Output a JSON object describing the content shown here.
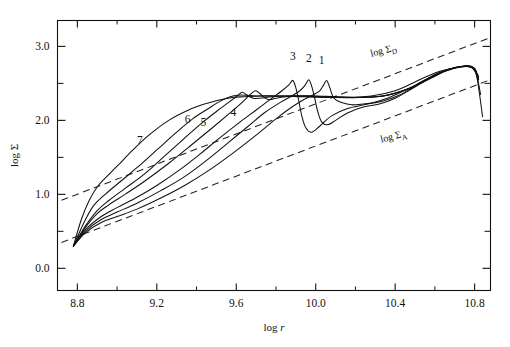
{
  "chart_data": {
    "type": "line",
    "title": "",
    "xlabel": "log r",
    "ylabel": "log Σ",
    "xlim": [
      8.7,
      10.88
    ],
    "ylim": [
      -0.3,
      3.35
    ],
    "grid": false,
    "legend_position": "inline-annotations",
    "x_major_ticks": [
      "8.8",
      "9.2",
      "9.6",
      "10.0",
      "10.4",
      "10.8"
    ],
    "x_major_values": [
      8.8,
      9.2,
      9.6,
      10.0,
      10.4,
      10.8
    ],
    "x_minor_values": [
      9.0,
      9.4,
      9.8,
      10.2,
      10.6
    ],
    "y_major_ticks": [
      "0.0",
      "1.0",
      "2.0",
      "3.0"
    ],
    "y_major_values": [
      0.0,
      1.0,
      2.0,
      3.0
    ],
    "y_minor_values": [
      0.5,
      1.5,
      2.5
    ],
    "annotations": [
      {
        "text": "log Σ",
        "sub": "D",
        "x": 10.28,
        "y": 2.86,
        "rotation": -14,
        "name": "sigma-d-label"
      },
      {
        "text": "log Σ",
        "sub": "A",
        "x": 10.33,
        "y": 1.7,
        "rotation": -14,
        "name": "sigma-a-label"
      }
    ],
    "reference_lines": [
      {
        "name": "log Σ_D",
        "style": "dashed",
        "x": [
          8.72,
          10.88
        ],
        "y": [
          0.92,
          3.12
        ]
      },
      {
        "name": "log Σ_A",
        "style": "dashed",
        "x": [
          8.72,
          10.88
        ],
        "y": [
          0.35,
          2.55
        ]
      }
    ],
    "series": [
      {
        "name": "1",
        "label": "1",
        "label_x": 10.03,
        "label_y": 2.76,
        "x": [
          8.78,
          8.84,
          8.92,
          9.0,
          9.1,
          9.22,
          9.34,
          9.46,
          9.58,
          9.7,
          9.8,
          9.88,
          9.94,
          9.99,
          10.02,
          10.04,
          10.055,
          10.07,
          10.085,
          10.1,
          10.13,
          10.18,
          10.24,
          10.3,
          10.36,
          10.42,
          10.48,
          10.54,
          10.6,
          10.66,
          10.72,
          10.76,
          10.79,
          10.81,
          10.825,
          10.84
        ],
        "y": [
          0.3,
          0.48,
          0.62,
          0.7,
          0.8,
          0.95,
          1.12,
          1.32,
          1.55,
          1.8,
          2.02,
          2.18,
          2.28,
          2.35,
          2.4,
          2.48,
          2.54,
          2.45,
          2.33,
          2.28,
          2.24,
          2.21,
          2.22,
          2.24,
          2.28,
          2.34,
          2.43,
          2.53,
          2.62,
          2.68,
          2.72,
          2.74,
          2.72,
          2.6,
          2.35,
          2.05
        ]
      },
      {
        "name": "2",
        "label": "2",
        "label_x": 9.965,
        "label_y": 2.79,
        "x": [
          8.78,
          8.84,
          8.92,
          9.0,
          9.1,
          9.22,
          9.34,
          9.46,
          9.56,
          9.66,
          9.74,
          9.82,
          9.88,
          9.92,
          9.945,
          9.965,
          9.98,
          9.995,
          10.01,
          10.03,
          10.06,
          10.1,
          10.16,
          10.24,
          10.32,
          10.4,
          10.48,
          10.56,
          10.64,
          10.7,
          10.75,
          10.79,
          10.81,
          10.83
        ],
        "y": [
          0.3,
          0.5,
          0.66,
          0.76,
          0.88,
          1.05,
          1.24,
          1.48,
          1.7,
          1.92,
          2.1,
          2.24,
          2.33,
          2.4,
          2.47,
          2.55,
          2.46,
          2.3,
          2.12,
          1.98,
          1.94,
          2.0,
          2.1,
          2.18,
          2.22,
          2.3,
          2.42,
          2.55,
          2.66,
          2.71,
          2.73,
          2.72,
          2.62,
          2.35
        ]
      },
      {
        "name": "3",
        "label": "3",
        "label_x": 9.885,
        "label_y": 2.81,
        "x": [
          8.78,
          8.84,
          8.92,
          9.0,
          9.1,
          9.2,
          9.32,
          9.42,
          9.52,
          9.62,
          9.7,
          9.78,
          9.83,
          9.865,
          9.885,
          9.9,
          9.915,
          9.93,
          9.95,
          9.98,
          10.02,
          10.08,
          10.16,
          10.26,
          10.36,
          10.46,
          10.56,
          10.64,
          10.7,
          10.76,
          10.8,
          10.82
        ],
        "y": [
          0.3,
          0.52,
          0.7,
          0.82,
          0.96,
          1.12,
          1.34,
          1.55,
          1.77,
          1.98,
          2.14,
          2.3,
          2.4,
          2.48,
          2.54,
          2.44,
          2.26,
          2.06,
          1.9,
          1.84,
          1.92,
          2.06,
          2.16,
          2.22,
          2.3,
          2.42,
          2.56,
          2.66,
          2.71,
          2.73,
          2.7,
          2.55
        ]
      },
      {
        "name": "4",
        "label": "4",
        "label_x": 9.585,
        "label_y": 2.06,
        "x": [
          8.78,
          8.84,
          8.9,
          8.96,
          9.04,
          9.14,
          9.26,
          9.38,
          9.48,
          9.56,
          9.62,
          9.66,
          9.695,
          9.72,
          9.745,
          9.77,
          9.8,
          9.85,
          9.92,
          10.0,
          10.1,
          10.22,
          10.34,
          10.46,
          10.56,
          10.64,
          10.7,
          10.76,
          10.8,
          10.82
        ],
        "y": [
          0.3,
          0.55,
          0.74,
          0.86,
          1.0,
          1.18,
          1.42,
          1.68,
          1.9,
          2.08,
          2.22,
          2.32,
          2.4,
          2.36,
          2.3,
          2.28,
          2.3,
          2.32,
          2.33,
          2.33,
          2.32,
          2.31,
          2.33,
          2.42,
          2.55,
          2.66,
          2.71,
          2.73,
          2.7,
          2.55
        ]
      },
      {
        "name": "5",
        "label": "5",
        "label_x": 9.435,
        "label_y": 1.93,
        "x": [
          8.78,
          8.84,
          8.9,
          8.96,
          9.04,
          9.14,
          9.24,
          9.34,
          9.42,
          9.5,
          9.56,
          9.6,
          9.63,
          9.655,
          9.685,
          9.72,
          9.78,
          9.86,
          9.96,
          10.08,
          10.2,
          10.34,
          10.46,
          10.56,
          10.64,
          10.7,
          10.76,
          10.8,
          10.82
        ],
        "y": [
          0.3,
          0.57,
          0.78,
          0.92,
          1.08,
          1.28,
          1.52,
          1.76,
          1.95,
          2.12,
          2.24,
          2.32,
          2.38,
          2.34,
          2.3,
          2.3,
          2.32,
          2.33,
          2.33,
          2.32,
          2.31,
          2.33,
          2.42,
          2.55,
          2.66,
          2.71,
          2.73,
          2.7,
          2.55
        ]
      },
      {
        "name": "6",
        "label": "6",
        "label_x": 9.355,
        "label_y": 1.96,
        "x": [
          8.78,
          8.83,
          8.88,
          8.94,
          9.02,
          9.1,
          9.2,
          9.3,
          9.38,
          9.46,
          9.52,
          9.57,
          9.61,
          9.65,
          9.7,
          9.78,
          9.88,
          10.0,
          10.14,
          10.28,
          10.4,
          10.5,
          10.6,
          10.68,
          10.74,
          10.79,
          10.82
        ],
        "y": [
          0.3,
          0.6,
          0.84,
          1.0,
          1.18,
          1.36,
          1.6,
          1.84,
          2.02,
          2.16,
          2.26,
          2.32,
          2.34,
          2.34,
          2.33,
          2.33,
          2.33,
          2.32,
          2.31,
          2.33,
          2.4,
          2.52,
          2.64,
          2.7,
          2.73,
          2.71,
          2.58
        ]
      },
      {
        "name": "7",
        "label": "7",
        "label_x": 9.115,
        "label_y": 1.68,
        "x": [
          8.78,
          8.82,
          8.86,
          8.9,
          8.94,
          9.0,
          9.08,
          9.16,
          9.26,
          9.36,
          9.44,
          9.52,
          9.58,
          9.64,
          9.72,
          9.82,
          9.94,
          10.08,
          10.22,
          10.36,
          10.48,
          10.58,
          10.66,
          10.73,
          10.78,
          10.82
        ],
        "y": [
          0.3,
          0.66,
          0.92,
          1.1,
          1.22,
          1.38,
          1.6,
          1.8,
          2.0,
          2.14,
          2.22,
          2.28,
          2.31,
          2.32,
          2.33,
          2.33,
          2.32,
          2.31,
          2.31,
          2.34,
          2.44,
          2.57,
          2.67,
          2.72,
          2.72,
          2.6
        ]
      }
    ],
    "envelope_note": "all seven tracks merge into a common bundle beyond log r ~ 10.3, rising to a maximum near log Σ = 2.74 at log r = 10.77 before dropping steeply"
  },
  "axis": {
    "xlabel": "log r",
    "ylabel_prefix": "log",
    "ylabel_symbol": "Σ"
  },
  "colors": {
    "ink": "#111111",
    "background": "#ffffff",
    "curve": "#111111",
    "dashed": "#222222"
  }
}
